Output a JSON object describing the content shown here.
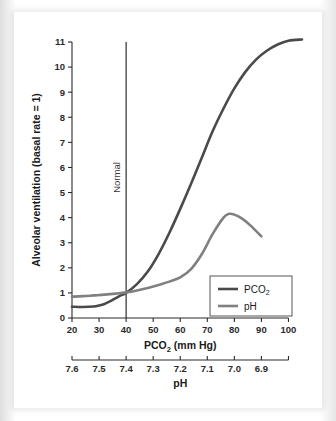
{
  "chart_data": {
    "type": "line",
    "title": "",
    "xlabel": "PCO2 (mm Hg)",
    "xlabel_main": "PCO",
    "xlabel_sub": "2",
    "xlabel_tail": " (mm Hg)",
    "ylabel": "Alveolar ventilation (basal rate = 1)",
    "secondary_xlabel": "pH",
    "xlim": [
      20,
      105
    ],
    "ylim": [
      0,
      11
    ],
    "grid": false,
    "legend_position": "lower-right",
    "x_ticks": [
      "20",
      "30",
      "40",
      "50",
      "60",
      "70",
      "80",
      "90",
      "100"
    ],
    "x_tick_values": [
      20,
      30,
      40,
      50,
      60,
      70,
      80,
      90,
      100
    ],
    "y_ticks": [
      "0",
      "1",
      "2",
      "3",
      "4",
      "5",
      "6",
      "7",
      "8",
      "9",
      "10",
      "11"
    ],
    "y_tick_values": [
      0,
      1,
      2,
      3,
      4,
      5,
      6,
      7,
      8,
      9,
      10,
      11
    ],
    "ph_ticks": [
      "7.6",
      "7.5",
      "7.4",
      "7.3",
      "7.2",
      "7.1",
      "7.0",
      "6.9"
    ],
    "ph_tick_values": [
      7.6,
      7.5,
      7.4,
      7.3,
      7.2,
      7.1,
      7.0,
      6.9
    ],
    "annotations": [
      {
        "text": "Normal",
        "x": 40,
        "orientation": "vertical",
        "line_from_y": 0,
        "line_to_y": 11
      }
    ],
    "series": [
      {
        "name": "PCO2",
        "legend_main": "PCO",
        "legend_sub": "2",
        "color": "#4a4a4a",
        "width": 2.6,
        "x": [
          20,
          24,
          28,
          30,
          32,
          34,
          36,
          38,
          40,
          44,
          48,
          52,
          56,
          60,
          64,
          68,
          72,
          76,
          80,
          84,
          88,
          92,
          96,
          100,
          105
        ],
        "values": [
          0.45,
          0.44,
          0.46,
          0.5,
          0.56,
          0.66,
          0.78,
          0.9,
          1.0,
          1.35,
          1.85,
          2.55,
          3.4,
          4.35,
          5.35,
          6.4,
          7.45,
          8.35,
          9.15,
          9.8,
          10.3,
          10.65,
          10.9,
          11.05,
          11.1
        ]
      },
      {
        "name": "pH",
        "legend_main": "pH",
        "legend_sub": "",
        "color": "#808080",
        "width": 2.6,
        "x": [
          20,
          24,
          28,
          32,
          36,
          40,
          44,
          48,
          52,
          56,
          60,
          64,
          68,
          72,
          76,
          78,
          80,
          83,
          86,
          90
        ],
        "values": [
          0.85,
          0.87,
          0.9,
          0.93,
          0.97,
          1.02,
          1.1,
          1.2,
          1.32,
          1.45,
          1.62,
          1.95,
          2.55,
          3.35,
          4.0,
          4.15,
          4.12,
          3.95,
          3.68,
          3.25
        ]
      }
    ]
  }
}
